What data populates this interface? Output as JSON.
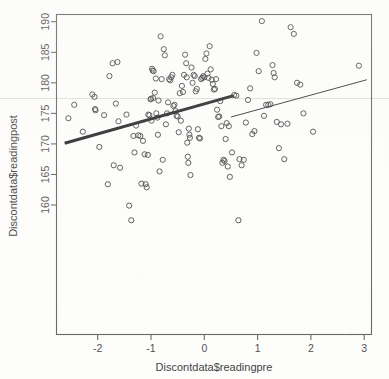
{
  "chart_data": {
    "type": "scatter",
    "title": "",
    "xlabel": "Discontdata$readingpre",
    "ylabel": "Discontdata$readingpost",
    "xlim": [
      -2.75,
      3.15
    ],
    "ylim": [
      157.0,
      191.0
    ],
    "xticks": [
      -2,
      -1,
      0,
      1,
      2,
      3
    ],
    "xtick_labels": [
      "-2",
      "-1",
      "0",
      "1",
      "2",
      "3"
    ],
    "yticks": [
      160,
      165,
      170,
      175,
      180,
      185,
      190
    ],
    "ytick_labels": [
      "160",
      "165",
      "170",
      "175",
      "180",
      "185",
      "190"
    ],
    "grid": false,
    "legend": null,
    "marker": "open-circle",
    "series": [
      {
        "name": "Discontdata observations",
        "x": [
          -2.55,
          -2.44,
          -2.28,
          -2.1,
          -2.06,
          -2.05,
          -2.04,
          -1.97,
          -1.88,
          -1.81,
          -1.78,
          -1.72,
          -1.7,
          -1.66,
          -1.63,
          -1.61,
          -1.58,
          -1.46,
          -1.41,
          -1.37,
          -1.33,
          -1.31,
          -1.28,
          -1.24,
          -1.2,
          -1.18,
          -1.15,
          -1.12,
          -1.1,
          -1.08,
          -1.06,
          -1.05,
          -1.03,
          -1.01,
          -1.0,
          -0.99,
          -0.98,
          -0.97,
          -0.96,
          -0.95,
          -0.93,
          -0.91,
          -0.9,
          -0.88,
          -0.87,
          -0.86,
          -0.84,
          -0.82,
          -0.8,
          -0.78,
          -0.76,
          -0.74,
          -0.72,
          -0.7,
          -0.68,
          -0.66,
          -0.64,
          -0.62,
          -0.6,
          -0.58,
          -0.56,
          -0.54,
          -0.52,
          -0.5,
          -0.48,
          -0.46,
          -0.44,
          -0.42,
          -0.4,
          -0.38,
          -0.36,
          -0.34,
          -0.33,
          -0.32,
          -0.31,
          -0.3,
          -0.29,
          -0.28,
          -0.27,
          -0.26,
          -0.24,
          -0.22,
          -0.2,
          -0.18,
          -0.16,
          -0.14,
          -0.12,
          -0.1,
          -0.08,
          -0.06,
          -0.04,
          -0.02,
          0.0,
          0.02,
          0.04,
          0.06,
          0.08,
          0.1,
          0.12,
          0.14,
          0.16,
          0.18,
          0.2,
          0.22,
          0.24,
          0.26,
          0.28,
          0.3,
          0.32,
          0.34,
          0.36,
          0.38,
          0.4,
          0.42,
          0.44,
          0.46,
          0.48,
          0.52,
          0.56,
          0.6,
          0.64,
          0.66,
          0.7,
          0.74,
          0.78,
          0.82,
          0.86,
          0.9,
          0.94,
          0.98,
          1.02,
          1.08,
          1.12,
          1.16,
          1.2,
          1.24,
          1.28,
          1.3,
          1.32,
          1.36,
          1.4,
          1.44,
          1.5,
          1.56,
          1.62,
          1.68,
          1.74,
          1.8,
          1.86,
          2.04,
          2.9
        ],
        "y": [
          174.2,
          176.4,
          172.0,
          178.1,
          177.7,
          175.7,
          175.5,
          169.5,
          174.7,
          163.4,
          181.1,
          183.2,
          166.5,
          176.6,
          183.4,
          173.7,
          166.1,
          174.8,
          159.9,
          157.5,
          171.3,
          168.6,
          173.0,
          171.4,
          171.3,
          163.5,
          170.5,
          168.3,
          163.4,
          162.9,
          168.2,
          174.8,
          174.7,
          177.3,
          177.4,
          173.8,
          182.3,
          182.0,
          177.5,
          181.9,
          178.4,
          180.7,
          175.0,
          174.3,
          171.5,
          177.1,
          165.5,
          187.6,
          180.6,
          167.4,
          185.5,
          184.5,
          173.2,
          175.0,
          176.8,
          180.6,
          180.4,
          180.9,
          181.3,
          176.2,
          176.4,
          175.4,
          174.6,
          174.5,
          171.9,
          178.3,
          173.8,
          179.5,
          178.5,
          181.3,
          184.6,
          183.2,
          180.9,
          170.2,
          167.9,
          166.9,
          172.5,
          171.5,
          171.0,
          164.9,
          182.5,
          180.0,
          181.3,
          181.1,
          178.6,
          179.0,
          172.4,
          171.0,
          170.9,
          180.6,
          180.8,
          181.1,
          180.9,
          183.9,
          184.8,
          181.5,
          180.8,
          186.0,
          182.2,
          180.5,
          179.8,
          178.9,
          179.0,
          180.6,
          175.6,
          174.4,
          174.5,
          177.0,
          172.9,
          166.9,
          167.4,
          167.2,
          170.8,
          173.4,
          166.3,
          172.9,
          164.6,
          168.6,
          178.0,
          177.9,
          157.5,
          167.5,
          166.5,
          167.4,
          173.5,
          177.2,
          179.1,
          171.6,
          172.1,
          184.9,
          181.9,
          190.1,
          174.6,
          176.4,
          176.4,
          176.5,
          182.9,
          181.6,
          180.9,
          173.6,
          169.3,
          173.2,
          167.5,
          173.3,
          189.1,
          188.0,
          180.0,
          179.7,
          175.0,
          172.0,
          182.8
        ]
      }
    ],
    "fit_lines": [
      {
        "name": "left-segment-regression-line",
        "style": "thick",
        "x_start": -2.62,
        "y_start": 170.1,
        "x_end": 0.55,
        "y_end": 177.9
      },
      {
        "name": "right-segment-regression-line",
        "style": "thin",
        "x_start": 0.5,
        "y_start": 174.4,
        "x_end": 3.05,
        "y_end": 180.5
      }
    ]
  },
  "colors": {
    "point_stroke": "#2a2a2a",
    "axis": "#555555",
    "text": "#2b2b2b",
    "thick_fit": "#111111",
    "thin_fit": "#222222",
    "background": "#fdfdfc"
  }
}
